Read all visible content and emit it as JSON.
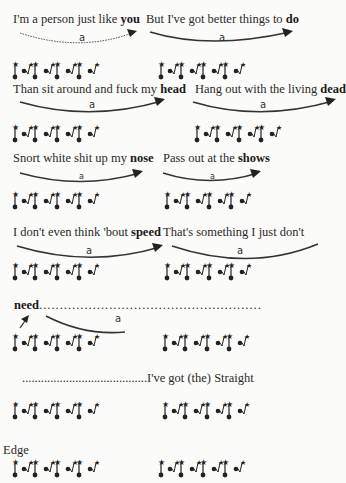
{
  "page": {
    "ink_color": "#2a2a2a",
    "background": "#fbfbf9"
  },
  "lines": [
    {
      "left": {
        "pre": "I'm a person just like ",
        "bold": "you"
      },
      "right": {
        "pre": "But I've got better things to ",
        "bold": "do"
      },
      "arcs": [
        {
          "label": "a",
          "style": "dotted"
        },
        {
          "label": "a",
          "style": "solid"
        }
      ]
    },
    {
      "left": {
        "pre": "Than sit around and fuck my ",
        "bold": "head"
      },
      "right": {
        "pre": "Hang out with the living ",
        "bold": "dead"
      },
      "arcs": [
        {
          "label": "a",
          "style": "solid"
        },
        {
          "label": "a",
          "style": "solid"
        }
      ]
    },
    {
      "left": {
        "pre": "Snort white shit up my ",
        "bold": "nose"
      },
      "right": {
        "pre": "Pass out at the ",
        "bold": "shows"
      },
      "arcs": [
        {
          "label": "a",
          "style": "solid"
        },
        {
          "label": "a",
          "style": "solid"
        }
      ]
    },
    {
      "left": {
        "pre": "I don't even think 'bout ",
        "bold": "speed"
      },
      "right": {
        "pre": "That's something I just don't",
        "bold": ""
      },
      "arcs": [
        {
          "label": "a",
          "style": "solid"
        },
        {
          "label": "a",
          "style": "solid"
        }
      ]
    },
    {
      "left": {
        "pre": "",
        "bold": "need"
      },
      "dots": "......................................................",
      "arcs": [
        {
          "label": "a",
          "style": "solid"
        }
      ]
    },
    {
      "right_text": "........................................I've got (the) Straight"
    },
    {
      "left_text": "Edge"
    }
  ],
  "glyph_pattern": [
    "stress",
    "pair",
    "stress",
    "pair",
    "stress",
    "pair",
    "stress",
    "unstressed-end"
  ]
}
